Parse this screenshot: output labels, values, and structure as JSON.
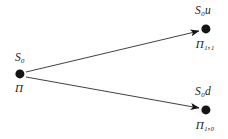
{
  "figure": {
    "type": "binomial-tree-diagram",
    "background_color": "#ffffff",
    "ink_color": "#141414",
    "width": 228,
    "height": 139
  },
  "nodes": [
    {
      "id": "root",
      "name": "root-node",
      "x": 20,
      "y": 74,
      "radius": 4.6,
      "label_above": "S",
      "label_above_sub": "0",
      "label_below": "П",
      "label_below_sub": ""
    },
    {
      "id": "up",
      "name": "up-node",
      "x": 206,
      "y": 29,
      "radius": 4.6,
      "label_above": "S",
      "label_above_sub": "0",
      "label_above_suffix": "u",
      "label_below": "П",
      "label_below_sub": "1,1"
    },
    {
      "id": "down",
      "name": "down-node",
      "x": 206,
      "y": 110,
      "radius": 4.6,
      "label_above": "S",
      "label_above_sub": "0",
      "label_above_suffix": "d",
      "label_below": "П",
      "label_below_sub": "1,0"
    }
  ],
  "labels": {
    "root_above": "S₀",
    "root_below": "П",
    "up_above": "S₀u",
    "up_below": "П₁,₁",
    "down_above": "S₀d",
    "down_below": "П₁,₀"
  },
  "edges": [
    {
      "id": "edge-up",
      "name": "edge-root-to-up",
      "from": "root",
      "to": "up",
      "x1": 26,
      "y1": 72,
      "x2": 199,
      "y2": 31,
      "stroke_width": 0.9,
      "arrowhead": true
    },
    {
      "id": "edge-down",
      "name": "edge-root-to-down",
      "from": "root",
      "to": "down",
      "x1": 26,
      "y1": 77,
      "x2": 199,
      "y2": 108,
      "stroke_width": 0.9,
      "arrowhead": true
    }
  ]
}
